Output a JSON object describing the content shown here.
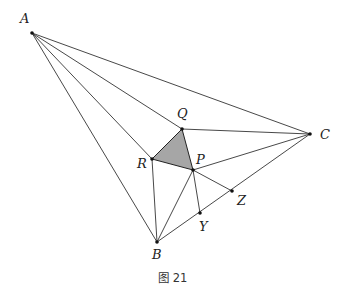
{
  "figure": {
    "caption": "图 21",
    "shaded_color": "#a6a6a6",
    "line_color": "#333333"
  },
  "points": {
    "A": {
      "label": "A",
      "x": 32,
      "y": 33
    },
    "B": {
      "label": "B",
      "x": 157,
      "y": 242
    },
    "C": {
      "label": "C",
      "x": 310,
      "y": 134
    },
    "P": {
      "label": "P",
      "x": 193,
      "y": 170
    },
    "Q": {
      "label": "Q",
      "x": 182,
      "y": 129
    },
    "R": {
      "label": "R",
      "x": 152,
      "y": 159
    },
    "Y": {
      "label": "Y",
      "x": 200,
      "y": 213
    },
    "Z": {
      "label": "Z",
      "x": 232,
      "y": 191
    }
  },
  "segments": [
    [
      "A",
      "C"
    ],
    [
      "A",
      "Q"
    ],
    [
      "A",
      "R"
    ],
    [
      "A",
      "B"
    ],
    [
      "Q",
      "C"
    ],
    [
      "P",
      "C"
    ],
    [
      "B",
      "C"
    ],
    [
      "B",
      "R"
    ],
    [
      "B",
      "P"
    ],
    [
      "P",
      "Y"
    ],
    [
      "P",
      "Z"
    ],
    [
      "Q",
      "R"
    ],
    [
      "R",
      "P"
    ],
    [
      "P",
      "Q"
    ]
  ],
  "shaded_triangle": [
    "P",
    "Q",
    "R"
  ]
}
